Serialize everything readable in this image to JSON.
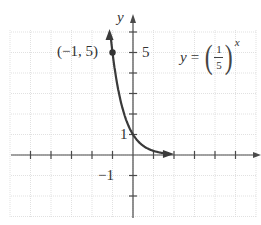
{
  "chart_data": {
    "type": "line",
    "title": "",
    "equation": {
      "lhs": "y",
      "equals": "=",
      "numerator": "1",
      "denominator": "5",
      "exponent": "x"
    },
    "xlabel": "x",
    "ylabel": "y",
    "xlim": [
      -6,
      6
    ],
    "ylim": [
      -3,
      6
    ],
    "grid": true,
    "tick_labels": {
      "y": [
        {
          "value": 5,
          "label": "5"
        },
        {
          "value": 1,
          "label": "1"
        },
        {
          "value": -1,
          "label": "−1"
        }
      ]
    },
    "annotated_point": {
      "x": -1,
      "y": 5,
      "label": "(−1, 5)"
    },
    "series": [
      {
        "name": "y = (1/5)^x",
        "x": [
          -1,
          -0.75,
          -0.5,
          -0.25,
          0,
          0.25,
          0.5,
          1,
          1.5,
          2
        ],
        "y": [
          5,
          3.34,
          2.24,
          1.5,
          1,
          0.67,
          0.45,
          0.2,
          0.09,
          0.04
        ]
      }
    ]
  },
  "labels": {
    "y_axis": "y",
    "tick_5": "5",
    "tick_1": "1",
    "tick_neg1": "−1",
    "point": "(−1, 5)"
  },
  "colors": {
    "curve": "#3a3a3a",
    "axis": "#444444",
    "grid": "#d8d8d8"
  }
}
